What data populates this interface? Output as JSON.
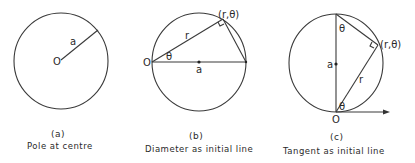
{
  "figures": [
    {
      "id": "(a)",
      "caption": "Pole at centre",
      "labels": {
        "pole": "O",
        "radius": "a"
      }
    },
    {
      "id": "(b)",
      "caption": "Diameter as initial line",
      "labels": {
        "pole": "O",
        "radius_mark": "a",
        "point": "(r,θ)",
        "side": "r",
        "angle": "θ"
      }
    },
    {
      "id": "(c)",
      "caption": "Tangent as initial line",
      "labels": {
        "pole": "O",
        "radius_mark": "a",
        "point": "(r,θ)",
        "side": "r",
        "angle_top": "θ",
        "angle_bottom": "θ"
      }
    }
  ],
  "colors": {
    "line": "#3a3a3a",
    "text": "#2a2a2a",
    "background": "#ffffff"
  }
}
